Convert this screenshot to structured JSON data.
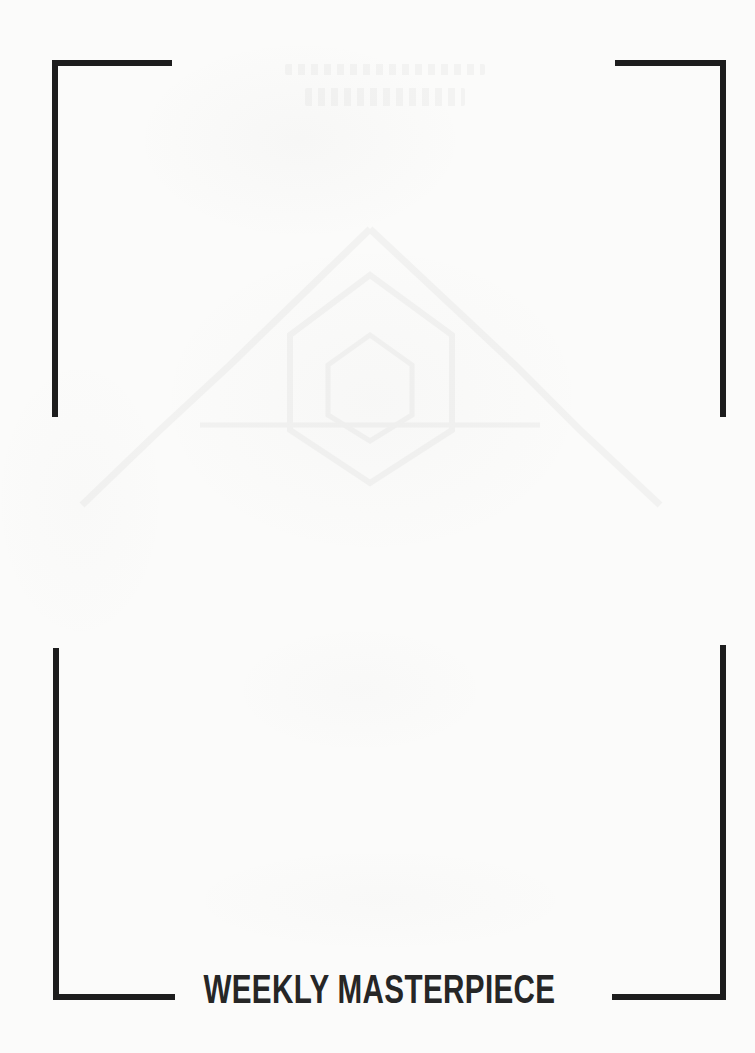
{
  "page": {
    "kind": "scanned-page",
    "background_color": "#fbfbfa",
    "ink_color": "#1d1d1d",
    "title_color": "#262626",
    "width": 755,
    "height": 1053
  },
  "title": {
    "text": "WEEKLY MASTERPIECE"
  },
  "crop_marks": {
    "label": "corner-brackets",
    "stroke_color": "#1d1d1d",
    "stroke_width": 6,
    "corners": [
      {
        "name": "top-left",
        "corner_x": 52,
        "corner_y": 60,
        "horizontal_length": 120,
        "vertical_length": 357
      },
      {
        "name": "top-right",
        "corner_x": 726,
        "corner_y": 60,
        "horizontal_length": 111,
        "vertical_length": 357
      },
      {
        "name": "bottom-left",
        "corner_x": 55,
        "corner_y": 1000,
        "horizontal_length": 120,
        "vertical_length": 352
      },
      {
        "name": "bottom-right",
        "corner_x": 726,
        "corner_y": 1000,
        "horizontal_length": 114,
        "vertical_length": 355
      }
    ]
  },
  "show_through": {
    "label": "faint-bleed-through-from-reverse-side",
    "emblem_shape": "mountain-triangle",
    "opacity": "very-low"
  }
}
